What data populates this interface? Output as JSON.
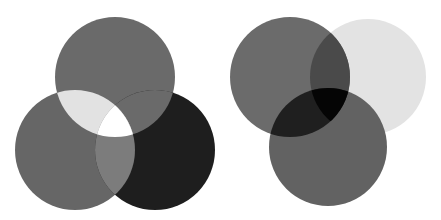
{
  "figure": {
    "background": "#ffffff"
  },
  "diagrams": [
    {
      "name": "additive-venn",
      "circles": [
        {
          "label": "top",
          "cx": 115,
          "cy": 77,
          "r": 60,
          "color": "#6a6a6a"
        },
        {
          "label": "bottom-left",
          "cx": 75,
          "cy": 150,
          "r": 60,
          "color": "#666666"
        },
        {
          "label": "bottom-right",
          "cx": 155,
          "cy": 150,
          "r": 60,
          "color": "#1e1e1e"
        }
      ],
      "overlaps": {
        "top_and_left": "#e2e2e2",
        "left_and_right": "#7c7c7c",
        "top_and_right": "#6a6a6a",
        "all_three": "#ffffff"
      }
    },
    {
      "name": "subtractive-venn",
      "circles": [
        {
          "label": "top-left",
          "cx": 290,
          "cy": 77,
          "r": 60,
          "color": "#6b6b6b"
        },
        {
          "label": "top-right",
          "cx": 368,
          "cy": 77,
          "r": 58,
          "color": "#e3e3e3"
        },
        {
          "label": "bottom",
          "cx": 328,
          "cy": 147,
          "r": 59,
          "color": "#626262"
        }
      ],
      "overlaps": {
        "top_left_and_top_right": "#4a4a4a",
        "top_left_and_bottom": "#1f1f1f",
        "top_right_and_bottom": "#626262",
        "all_three": "#050505"
      }
    }
  ]
}
